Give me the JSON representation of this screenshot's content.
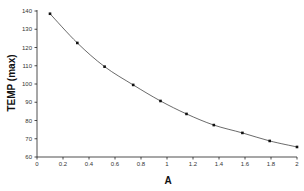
{
  "chart_data": {
    "type": "line",
    "title": "",
    "xlabel": "A",
    "ylabel": "TEMP (max)",
    "xlim": [
      0,
      2
    ],
    "ylim": [
      60,
      140
    ],
    "grid": false,
    "legend": null,
    "x_ticks": [
      "0",
      "0.2",
      "0.4",
      "0.6",
      "0.8",
      "1",
      "1.2",
      "1.4",
      "1.6",
      "1.8",
      "2"
    ],
    "y_ticks": [
      "60",
      "70",
      "80",
      "90",
      "100",
      "110",
      "120",
      "130",
      "140"
    ],
    "series": [
      {
        "name": "TEMP (max)",
        "marker": "square",
        "x": [
          0.1,
          0.31,
          0.52,
          0.74,
          0.95,
          1.15,
          1.36,
          1.58,
          1.79,
          2.0
        ],
        "values": [
          138.5,
          122.5,
          109.5,
          99.5,
          90.7,
          83.6,
          77.5,
          73.2,
          68.8,
          65.5
        ]
      }
    ]
  }
}
